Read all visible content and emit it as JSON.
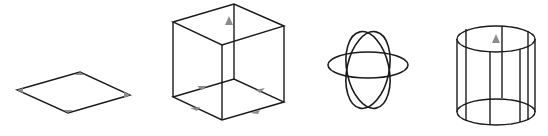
{
  "figure": {
    "description": "Four wireframe 3D primitives with gray triangular direction markers",
    "shapes": [
      {
        "id": "plane",
        "label": "plane",
        "markers": 4
      },
      {
        "id": "cube",
        "label": "cube",
        "markers": 5
      },
      {
        "id": "sphere",
        "label": "sphere",
        "markers": 0
      },
      {
        "id": "cylinder",
        "label": "cylinder",
        "markers": 1
      }
    ],
    "colors": {
      "stroke": "#1a1a1a",
      "marker": "#8c8c8c",
      "background": "#ffffff"
    }
  }
}
